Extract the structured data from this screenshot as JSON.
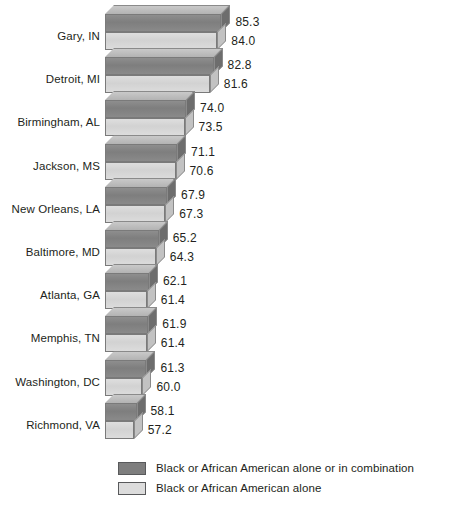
{
  "chart_data": {
    "type": "bar",
    "orientation": "horizontal",
    "title": "",
    "subtitle": "",
    "xlabel": "",
    "ylabel": "",
    "grid": false,
    "legend_position": "bottom",
    "xlim": [
      48,
      88
    ],
    "categories": [
      "Gary, IN",
      "Detroit, MI",
      "Birmingham, AL",
      "Jackson, MS",
      "New Orleans, LA",
      "Baltimore, MD",
      "Atlanta, GA",
      "Memphis, TN",
      "Washington, DC",
      "Richmond, VA"
    ],
    "series": [
      {
        "name": "Black or African American alone or in combination",
        "color": "#7e7e7e",
        "values": [
          85.3,
          82.8,
          74.0,
          71.1,
          67.9,
          65.2,
          62.1,
          61.9,
          61.3,
          58.1
        ]
      },
      {
        "name": "Black or African American alone",
        "color": "#dcdcdc",
        "values": [
          84.0,
          81.6,
          73.5,
          70.6,
          67.3,
          64.3,
          61.4,
          61.4,
          60.0,
          57.2
        ]
      }
    ],
    "value_labels": [
      [
        "85.3",
        "84.0"
      ],
      [
        "82.8",
        "81.6"
      ],
      [
        "74.0",
        "73.5"
      ],
      [
        "71.1",
        "70.6"
      ],
      [
        "67.9",
        "67.3"
      ],
      [
        "65.2",
        "64.3"
      ],
      [
        "62.1",
        "61.4"
      ],
      [
        "61.9",
        "61.4"
      ],
      [
        "61.3",
        "60.0"
      ],
      [
        "58.1",
        "57.2"
      ]
    ]
  },
  "legend": {
    "items": [
      {
        "label": "Black or African American alone or in combination",
        "color": "#7e7e7e"
      },
      {
        "label": "Black or African American alone",
        "color": "#dcdcdc"
      }
    ]
  }
}
